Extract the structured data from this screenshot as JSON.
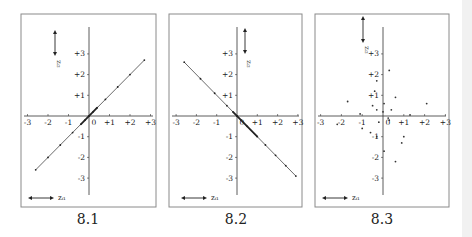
{
  "figure": {
    "captions": [
      "8.1",
      "8.2",
      "8.3"
    ]
  },
  "chart_data": [
    {
      "type": "line",
      "title": "8.1",
      "xlabel": "z_{i1}",
      "ylabel": "z_{i2}",
      "xlim": [
        -3,
        3
      ],
      "ylim": [
        -3,
        3
      ],
      "x_ticks": [
        "-3",
        "-2",
        "-1",
        "0",
        "+1",
        "+2",
        "+3"
      ],
      "y_ticks": [
        "+3",
        "+2",
        "+1",
        "-1",
        "-2",
        "-3"
      ],
      "grid": false,
      "description": "Perfect positive correlation (r = +1): points lie on line z2 = z1",
      "x": [
        -2.6,
        -2.0,
        -1.4,
        -0.8,
        -0.4,
        -0.2,
        0.0,
        0.2,
        0.4,
        0.8,
        1.4,
        2.0,
        2.7
      ],
      "y": [
        -2.6,
        -2.0,
        -1.4,
        -0.8,
        -0.4,
        -0.2,
        0.0,
        0.2,
        0.4,
        0.8,
        1.4,
        2.0,
        2.7
      ]
    },
    {
      "type": "line",
      "title": "8.2",
      "xlabel": "z_{i1}",
      "ylabel": "z_{i2}",
      "xlim": [
        -3,
        3
      ],
      "ylim": [
        -3,
        3
      ],
      "x_ticks": [
        "-3",
        "-2",
        "-1",
        "0",
        "+1",
        "+2",
        "+3"
      ],
      "y_ticks": [
        "+3",
        "+2",
        "+1",
        "-1",
        "-2",
        "-3"
      ],
      "grid": false,
      "description": "Perfect negative correlation (r = -1): points lie on line z2 = -z1",
      "x": [
        -2.6,
        -1.8,
        -1.1,
        -0.5,
        -0.2,
        0.0,
        0.2,
        0.5,
        1.0,
        1.4,
        1.9,
        2.4,
        2.9
      ],
      "y": [
        2.6,
        1.8,
        1.1,
        0.5,
        0.2,
        0.0,
        -0.2,
        -0.5,
        -1.0,
        -1.4,
        -1.9,
        -2.4,
        -2.9
      ]
    },
    {
      "type": "scatter",
      "title": "8.3",
      "xlabel": "z_{i1}",
      "ylabel": "z_{i2}",
      "xlim": [
        -3,
        3
      ],
      "ylim": [
        -3,
        3
      ],
      "x_ticks": [
        "-3",
        "-2",
        "-1",
        "0",
        "+1",
        "+2",
        "+3"
      ],
      "y_ticks": [
        "+3",
        "+2",
        "+1",
        "-1",
        "-2",
        "-3"
      ],
      "grid": false,
      "description": "No correlation (r approx. 0): scattered points",
      "x": [
        -1.7,
        -1.1,
        -0.5,
        -0.4,
        -0.3,
        -0.3,
        0.05,
        0.3,
        0.4,
        0.6,
        1.3,
        2.1,
        -2.2,
        -1.0,
        -0.6,
        -0.3,
        0.25,
        0.9,
        1.0,
        0.05,
        0.6,
        0.3,
        -0.2,
        0.0
      ],
      "y": [
        0.7,
        0.1,
        0.5,
        1.2,
        0.3,
        1.7,
        0.6,
        2.2,
        0.3,
        0.9,
        0.05,
        0.6,
        -0.4,
        -0.6,
        -0.8,
        -1.0,
        -0.1,
        -1.3,
        -1.0,
        -1.7,
        -2.2,
        -0.2,
        -0.3,
        0.2
      ]
    }
  ]
}
